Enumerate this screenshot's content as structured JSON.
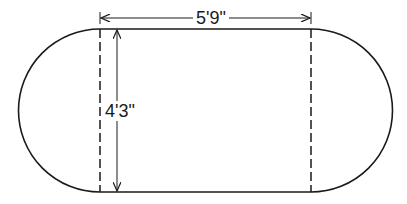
{
  "diagram": {
    "shape": "stadium (rectangle with semicircular ends)",
    "stroke_color": "#1a1a1a",
    "background": "#ffffff",
    "dimensions": {
      "width_label": "5'9\"",
      "height_label": "4'3\""
    }
  }
}
